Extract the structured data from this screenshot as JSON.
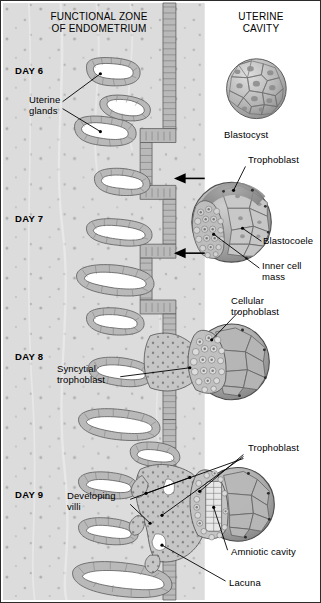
{
  "figure": {
    "title_left": "FUNCTIONAL ZONE\nOF ENDOMETRIUM",
    "title_right": "UTERINE\nCAVITY",
    "type": "biological-diagram",
    "border_color": "#2b2b2b",
    "stroma_color": "#dcdcdc",
    "epithelium_color": "#b9b9b9",
    "lumen_color": "#ffffff",
    "ink_color": "#000000"
  },
  "stages": [
    {
      "day_label": "DAY 6",
      "y": 70
    },
    {
      "day_label": "DAY 7",
      "y": 218
    },
    {
      "day_label": "DAY 8",
      "y": 356
    },
    {
      "day_label": "DAY 9",
      "y": 494
    }
  ],
  "labels": [
    {
      "name": "uterine-glands",
      "text": "Uterine\nglands",
      "x": 28,
      "y": 98
    },
    {
      "name": "blastocyst",
      "text": "Blastocyst",
      "x": 223,
      "y": 133
    },
    {
      "name": "trophoblast-day7",
      "text": "Trophoblast",
      "x": 247,
      "y": 158
    },
    {
      "name": "blastocoele",
      "text": "Blastocoele",
      "x": 265,
      "y": 238
    },
    {
      "name": "inner-cell-mass",
      "text": "Inner cell\nmass",
      "x": 263,
      "y": 263
    },
    {
      "name": "cellular-trophoblast",
      "text": "Cellular\ntrophoblast",
      "x": 232,
      "y": 299
    },
    {
      "name": "syncytial-trophoblast",
      "text": "Syncytial\ntrophoblast",
      "x": 65,
      "y": 368
    },
    {
      "name": "trophoblast-day9",
      "text": "Trophoblast",
      "x": 247,
      "y": 446
    },
    {
      "name": "developing-villi",
      "text": "Developing\nvilli",
      "x": 72,
      "y": 494
    },
    {
      "name": "amniotic-cavity",
      "text": "Amniotic cavity",
      "x": 230,
      "y": 549
    },
    {
      "name": "lacuna",
      "text": "Lacuna",
      "x": 228,
      "y": 580
    }
  ],
  "structures": {
    "blastocyst_day6": {
      "cx": 257,
      "cy": 88,
      "r": 30,
      "cells": "polygonal blastomeres"
    },
    "blastocyst_day7": {
      "cx": 232,
      "cy": 222,
      "r": 40,
      "inner_cell_mass": "left",
      "blastocoele": "right"
    },
    "embryo_day8": {
      "cx": 230,
      "cy": 362,
      "r": 38,
      "cellular_trophoblast": "left-rim",
      "syncytial_trophoblast": "invading"
    },
    "embryo_day9": {
      "cx": 233,
      "cy": 505,
      "r": 38,
      "amniotic_cavity": "central",
      "lacuna": "in-syncytium"
    },
    "arrows": [
      {
        "name": "implantation-arrow-upper",
        "x1": 205,
        "y1": 178,
        "x2": 176,
        "y2": 178
      },
      {
        "name": "implantation-arrow-lower",
        "x1": 205,
        "y1": 253,
        "x2": 176,
        "y2": 253
      }
    ]
  }
}
